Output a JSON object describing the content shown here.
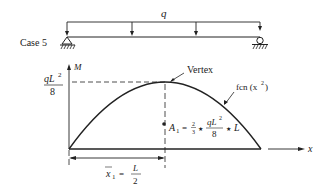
{
  "case_label": "Case 5",
  "load": {
    "symbol": "q"
  },
  "moment_axis": {
    "label": "M"
  },
  "x_axis": {
    "label": "x"
  },
  "max_moment": {
    "numerator": "qL",
    "exponent": "2",
    "denominator": "8"
  },
  "vertex_label": "Vertex",
  "curve_label": {
    "text": "fcn (x",
    "exponent": "2",
    "close": ")"
  },
  "area": {
    "name": "A",
    "subscript": "1",
    "equals": "=",
    "frac_num": "2",
    "frac_den": "3",
    "star": "★",
    "qL2_num": "qL",
    "qL2_exp": "2",
    "qL2_den": "8",
    "length": "L"
  },
  "centroid": {
    "name": "x",
    "subscript": "1",
    "equals": "=",
    "num": "L",
    "den": "2"
  },
  "colors": {
    "ink": "#222222",
    "background": "#ffffff"
  }
}
